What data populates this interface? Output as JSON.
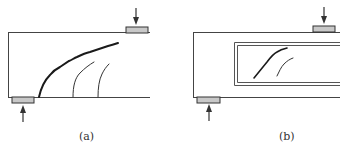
{
  "figure": {
    "panels": [
      {
        "id": "a",
        "label": "(a)",
        "description": "Beam end with shear cracks (solid web)",
        "cracks": [
          "main-diagonal-crack",
          "secondary-crack-1",
          "secondary-crack-2"
        ]
      },
      {
        "id": "b",
        "label": "(b)",
        "description": "Beam end with web opening and diagonal cracks",
        "cracks": [
          "diagonal-crack-1",
          "diagonal-crack-2"
        ]
      }
    ],
    "colors": {
      "line": "#333333",
      "plate_fill": "#c8c8c8",
      "plate_stroke": "#333333",
      "crack": "#1a1a1a"
    }
  }
}
